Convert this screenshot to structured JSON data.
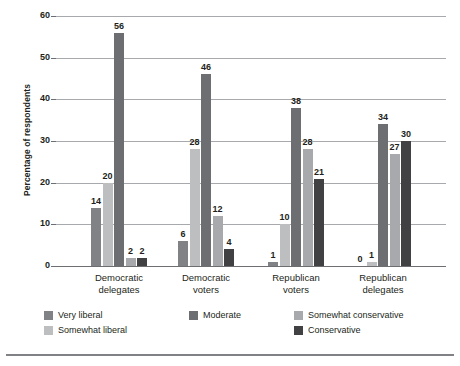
{
  "chart_data": {
    "type": "bar",
    "title": "",
    "subtitle": "",
    "xlabel": "",
    "ylabel": "Percentage of respondents",
    "ylim": [
      0,
      60
    ],
    "yticks": [
      0,
      10,
      20,
      30,
      40,
      50,
      60
    ],
    "ytick_labels": [
      "0",
      "10",
      "20",
      "30",
      "40",
      "50",
      "60"
    ],
    "grid": true,
    "legend_position": "bottom",
    "categories": [
      "Democratic delegates",
      "Democratic voters",
      "Republican voters",
      "Republican delegates"
    ],
    "category_lines": [
      [
        "Democratic",
        "delegates"
      ],
      [
        "Democratic",
        "voters"
      ],
      [
        "Republican",
        "voters"
      ],
      [
        "Republican",
        "delegates"
      ]
    ],
    "series": [
      {
        "name": "Very liberal",
        "color": "#808285",
        "values": [
          14,
          6,
          1,
          0
        ]
      },
      {
        "name": "Somewhat liberal",
        "color": "#bcbec0",
        "values": [
          20,
          28,
          10,
          1
        ]
      },
      {
        "name": "Moderate",
        "color": "#6d6e71",
        "values": [
          56,
          46,
          38,
          34
        ]
      },
      {
        "name": "Somewhat conservative",
        "color": "#a7a9ac",
        "values": [
          2,
          12,
          28,
          27
        ]
      },
      {
        "name": "Conservative",
        "color": "#414042",
        "values": [
          2,
          4,
          21,
          30
        ]
      }
    ],
    "data_labels": [
      [
        "14",
        "20",
        "56",
        "2",
        "2"
      ],
      [
        "6",
        "28",
        "46",
        "12",
        "4"
      ],
      [
        "1",
        "10",
        "38",
        "28",
        "21"
      ],
      [
        "0",
        "1",
        "34",
        "27",
        "30"
      ]
    ]
  },
  "legend": {
    "entries": [
      {
        "label": "Very liberal",
        "color": "#808285"
      },
      {
        "label": "Moderate",
        "color": "#6d6e71"
      },
      {
        "label": "Somewhat conservative",
        "color": "#a7a9ac"
      },
      {
        "label": "Somewhat liberal",
        "color": "#bcbec0"
      },
      {
        "label": "Conservative",
        "color": "#414042"
      }
    ]
  }
}
